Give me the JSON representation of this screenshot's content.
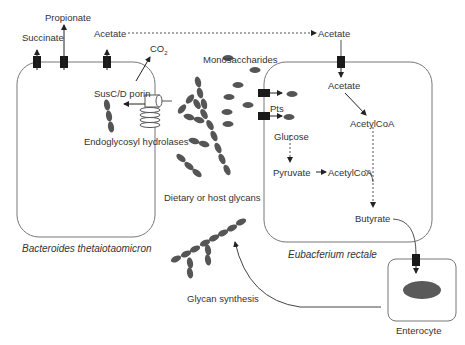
{
  "labels": {
    "succinate": "Succinate",
    "propionate": "Propionate",
    "acetate_left": "Acetate",
    "acetate_right_top": "Acetate",
    "co2": "CO",
    "co2_sub": "2",
    "monosaccharides": "Monosaccharides",
    "susc_porin": "SusC/D porin",
    "endoglycosyl": "Endoglycosyl hydrolases",
    "dietary_glycans": "Dietary or host glycans",
    "pts": "Pts",
    "acetate_inside": "Acetate",
    "acetylcoa_1": "AcetylCoA",
    "glucose": "Glucose",
    "pyruvate": "Pyruvate",
    "acetylcoa_2": "AcetylCoA",
    "butyrate": "Butyrate",
    "glycan_synthesis": "Glycan synthesis",
    "enterocyte": "Enterocyte"
  },
  "organisms": {
    "left": "Bacteroides thetaiotaomicron",
    "right": "Eubacferium rectale"
  },
  "colors": {
    "cell_outline": "#777777",
    "transporter": "#1a1a1a",
    "glycan": "#555555",
    "nucleus": "#5a5a5a"
  }
}
